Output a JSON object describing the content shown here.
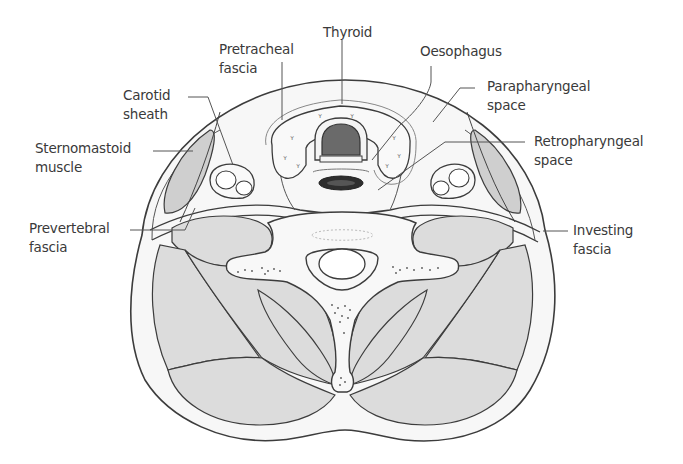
{
  "figure": {
    "colors": {
      "outline": "#3c3c3c",
      "muscle_fill": "#dcdcdc",
      "sternomastoid_fill": "#c8c8c8",
      "trachea_fill": "#6e6e6e",
      "oesophagus_fill": "#2e2e2e",
      "soft_tissue_fill": "#f4f4f4",
      "label_text": "#3a3a3a"
    },
    "labels": {
      "thyroid": {
        "line1": "Thyroid",
        "line2": ""
      },
      "pretracheal_fascia": {
        "line1": "Pretracheal",
        "line2": "fascia"
      },
      "oesophagus": {
        "line1": "Oesophagus",
        "line2": ""
      },
      "carotid_sheath": {
        "line1": "Carotid",
        "line2": "sheath"
      },
      "parapharyngeal_space": {
        "line1": "Parapharyngeal",
        "line2": "space"
      },
      "sternomastoid_muscle": {
        "line1": "Sternomastoid",
        "line2": "muscle"
      },
      "retropharyngeal_space": {
        "line1": "Retropharyngeal",
        "line2": "space"
      },
      "prevertebral_fascia": {
        "line1": "Prevertebral",
        "line2": "fascia"
      },
      "investing_fascia": {
        "line1": "Investing",
        "line2": "fascia"
      }
    }
  }
}
